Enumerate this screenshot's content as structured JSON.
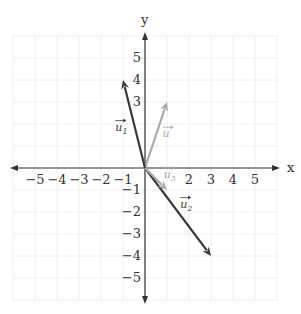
{
  "axes": {
    "x_label": "x",
    "y_label": "y",
    "x_ticks": [
      "−5",
      "−4",
      "−3",
      "−2",
      "−1",
      "2",
      "3",
      "4",
      "5"
    ],
    "x_tick_values": [
      -5,
      -4,
      -3,
      -2,
      -1,
      2,
      3,
      4,
      5
    ],
    "y_ticks": [
      "5",
      "4",
      "3",
      "−1",
      "−2",
      "−3",
      "−4",
      "−5"
    ],
    "y_tick_values": [
      5,
      4,
      3,
      -1,
      -2,
      -3,
      -4,
      -5
    ],
    "range": [
      -6,
      6
    ]
  },
  "vectors": [
    {
      "name": "u",
      "label": "u",
      "sub": "",
      "end": [
        1,
        3
      ],
      "color": "#aaaaaa",
      "label_pos": [
        0.8,
        1.4
      ]
    },
    {
      "name": "u1",
      "label": "u",
      "sub": "1",
      "end": [
        -1,
        4
      ],
      "color": "#3a3a3a",
      "label_pos": [
        -1.35,
        1.7
      ]
    },
    {
      "name": "u2",
      "label": "u",
      "sub": "2",
      "end": [
        3,
        -4
      ],
      "color": "#3a3a3a",
      "label_pos": [
        1.6,
        -1.8
      ]
    },
    {
      "name": "u3",
      "label": "u",
      "sub": "3",
      "end": [
        1,
        -1
      ],
      "color": "#aaaaaa",
      "label_pos": [
        0.85,
        -0.45
      ]
    }
  ],
  "colors": {
    "grid": "#eeeeee",
    "axis": "#333333",
    "dark_vector": "#3a3a3a",
    "light_vector": "#aaaaaa"
  }
}
